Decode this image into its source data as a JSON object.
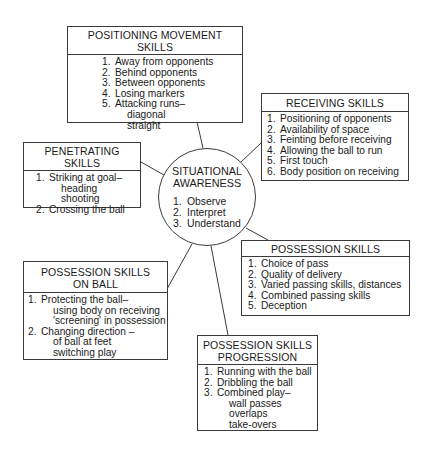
{
  "center": {
    "title_lines": [
      "SITUATIONAL",
      "AWARENESS"
    ],
    "items": [
      "Observe",
      "Interpret",
      "Understand"
    ]
  },
  "boxes": {
    "positioning": {
      "title_lines": [
        "POSITIONING MOVEMENT SKILLS"
      ],
      "items": [
        {
          "n": "1.",
          "text": "Away from opponents",
          "sub": []
        },
        {
          "n": "2.",
          "text": "Behind opponents",
          "sub": []
        },
        {
          "n": "3.",
          "text": "Between opponents",
          "sub": []
        },
        {
          "n": "4.",
          "text": "Losing markers",
          "sub": []
        },
        {
          "n": "5.",
          "text": "Attacking runs–",
          "sub": [
            "diagonal",
            "straight"
          ]
        }
      ]
    },
    "receiving": {
      "title_lines": [
        "RECEIVING SKILLS"
      ],
      "items": [
        {
          "n": "1.",
          "text": "Positioning of opponents",
          "sub": []
        },
        {
          "n": "2.",
          "text": "Availability of space",
          "sub": []
        },
        {
          "n": "3.",
          "text": "Feinting before receiving",
          "sub": []
        },
        {
          "n": "4.",
          "text": "Allowing the ball to run",
          "sub": []
        },
        {
          "n": "5.",
          "text": "First touch",
          "sub": []
        },
        {
          "n": "6.",
          "text": "Body position on receiving",
          "sub": []
        }
      ]
    },
    "penetrating": {
      "title_lines": [
        "PENETRATING SKILLS"
      ],
      "items": [
        {
          "n": "1.",
          "text": "Striking at goal–",
          "sub": [
            "heading",
            "shooting"
          ]
        },
        {
          "n": "2.",
          "text": "Crossing the ball",
          "sub": []
        }
      ]
    },
    "possession": {
      "title_lines": [
        "POSSESSION SKILLS"
      ],
      "items": [
        {
          "n": "1.",
          "text": "Choice of pass",
          "sub": []
        },
        {
          "n": "2.",
          "text": "Quality of delivery",
          "sub": []
        },
        {
          "n": "3.",
          "text": "Varied passing skills, distances",
          "sub": []
        },
        {
          "n": "4.",
          "text": "Combined passing skills",
          "sub": []
        },
        {
          "n": "5.",
          "text": "Deception",
          "sub": []
        }
      ]
    },
    "on_ball": {
      "title_lines": [
        "POSSESSION SKILLS",
        "ON BALL"
      ],
      "items": [
        {
          "n": "1.",
          "text": "Protecting the ball–",
          "sub": [
            "using body on receiving",
            "'screening' in possession"
          ]
        },
        {
          "n": "2.",
          "text": "Changing direction –",
          "sub": [
            "of ball at feet",
            "switching play"
          ]
        }
      ]
    },
    "progression": {
      "title_lines": [
        "POSSESSION SKILLS",
        "PROGRESSION"
      ],
      "items": [
        {
          "n": "1.",
          "text": "Running with the ball",
          "sub": []
        },
        {
          "n": "2.",
          "text": "Dribbling the ball",
          "sub": []
        },
        {
          "n": "3.",
          "text": "Combined play–",
          "sub": [
            "wall passes",
            "overlaps",
            "take-overs"
          ]
        }
      ]
    }
  },
  "connections": [
    {
      "from": "center",
      "to": "positioning"
    },
    {
      "from": "center",
      "to": "receiving"
    },
    {
      "from": "center",
      "to": "penetrating"
    },
    {
      "from": "center",
      "to": "possession"
    },
    {
      "from": "center",
      "to": "on_ball"
    },
    {
      "from": "center",
      "to": "progression"
    }
  ]
}
